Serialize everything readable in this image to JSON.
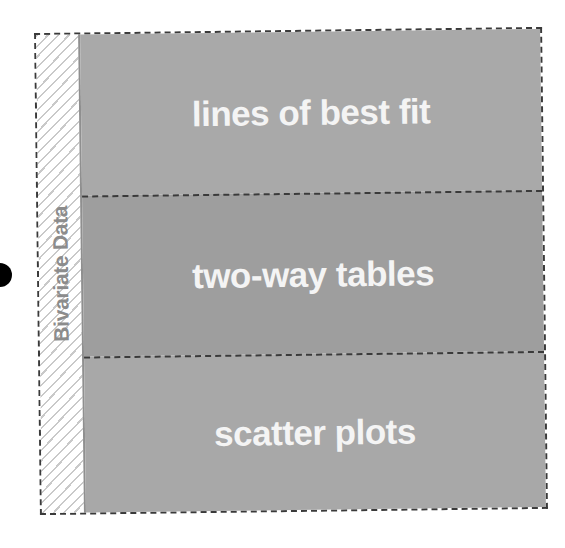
{
  "diagram": {
    "side_label": "Bivariate Data",
    "sections": [
      {
        "label": "lines of best fit",
        "color": "#a9a9a9",
        "height": 161
      },
      {
        "label": "two-way tables",
        "color": "#9e9e9e",
        "height": 161
      },
      {
        "label": "scatter plots",
        "color": "#a8a8a8",
        "height": 156
      }
    ],
    "colors": {
      "border": "#3a3a3a",
      "side_text": "#8c8c8c",
      "section_text": "#f4f4f4",
      "hatch": "#c9c9c9",
      "dot": "#000000"
    }
  }
}
